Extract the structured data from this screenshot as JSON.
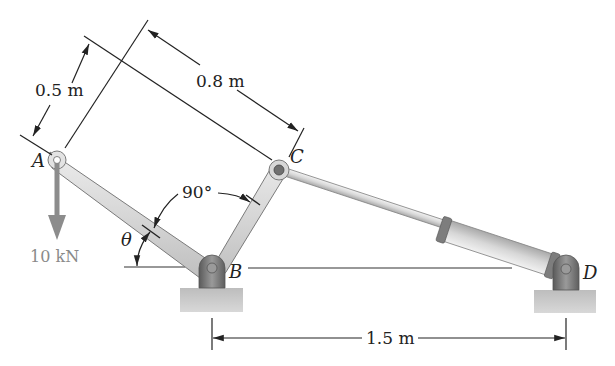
{
  "figure": {
    "points": {
      "A": {
        "label": "A"
      },
      "B": {
        "label": "B"
      },
      "C": {
        "label": "C"
      },
      "D": {
        "label": "D"
      }
    },
    "dimensions": {
      "AB_perp": "0.5 m",
      "BC_perp": "0.8 m",
      "BD_horizontal": "1.5 m"
    },
    "angles": {
      "bend_angle": "90°",
      "theta": "θ"
    },
    "load": {
      "label": "10 kN",
      "direction": "down",
      "point": "A"
    },
    "colors": {
      "member_fill": "#d9d9d9",
      "member_edge": "#7a7a7a",
      "pin_dark": "#6b6b6b",
      "ground_fill": "#c8c8c8",
      "cylinder_fill": "#dcdcdc",
      "collar_fill": "#7d7d7d",
      "load_arrow": "#8c8c8c",
      "line": "#222222"
    }
  }
}
